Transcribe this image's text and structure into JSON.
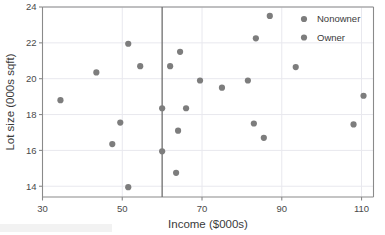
{
  "chart_data": {
    "type": "scatter",
    "title": "",
    "xlabel": "Income ($000s)",
    "ylabel": "Lot size (000s sqft)",
    "xlim": [
      30,
      113
    ],
    "ylim": [
      13.4,
      24
    ],
    "xticks": [
      30,
      50,
      70,
      90,
      110
    ],
    "yticks": [
      14,
      16,
      18,
      20,
      22,
      24
    ],
    "grid": true,
    "legend_position": "top-right",
    "marker_color": "#7d7d7d",
    "gridline_color": "#e8e8ee",
    "axis_color": "#8a8a8a",
    "split_line": {
      "orientation": "vertical",
      "x": 60,
      "color": "#6e6e6e"
    },
    "series": [
      {
        "name": "Nonowner",
        "color": "#7d7d7d",
        "points": [
          [
            34.5,
            18.8
          ],
          [
            43.5,
            20.35
          ],
          [
            47.5,
            16.35
          ],
          [
            49.5,
            17.55
          ],
          [
            51.5,
            21.95
          ],
          [
            51.5,
            13.95
          ],
          [
            54.5,
            20.7
          ],
          [
            60.0,
            18.35
          ],
          [
            60.0,
            15.95
          ],
          [
            62.0,
            20.7
          ],
          [
            63.5,
            14.75
          ]
        ]
      },
      {
        "name": "Owner",
        "color": "#7d7d7d",
        "points": [
          [
            64.5,
            21.5
          ],
          [
            64.0,
            17.1
          ],
          [
            66.0,
            18.35
          ],
          [
            69.5,
            19.9
          ],
          [
            75.0,
            19.5
          ],
          [
            81.5,
            19.9
          ],
          [
            83.5,
            22.25
          ],
          [
            83.0,
            17.5
          ],
          [
            85.5,
            16.7
          ],
          [
            87.0,
            23.5
          ],
          [
            93.5,
            20.65
          ],
          [
            108.0,
            17.45
          ],
          [
            110.5,
            19.05
          ]
        ]
      }
    ],
    "legend_entries": [
      {
        "label": "Nonowner",
        "color": "#7d7d7d"
      },
      {
        "label": "Owner",
        "color": "#7d7d7d"
      }
    ]
  }
}
